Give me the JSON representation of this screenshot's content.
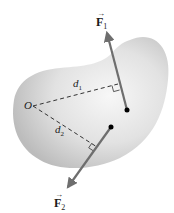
{
  "diagram": {
    "type": "torque-moment-arms",
    "colors": {
      "body_fill_light": "#f4f4f4",
      "body_fill_dark": "#bdbdbd",
      "vector": "#6e6e6e",
      "dashed": "#333333",
      "dot": "#000000",
      "text": "#1a1a1a"
    },
    "labels": {
      "F1": {
        "symbol": "F",
        "subscript": "1",
        "arrow": "→"
      },
      "F2": {
        "symbol": "F",
        "subscript": "2",
        "arrow": "→"
      },
      "O": "O",
      "d1": {
        "symbol": "d",
        "subscript": "1"
      },
      "d2": {
        "symbol": "d",
        "subscript": "2"
      }
    },
    "points": {
      "O": [
        33,
        106
      ],
      "F1_application": [
        127,
        110
      ],
      "F1_tip": [
        106,
        30
      ],
      "F2_application": [
        111,
        127
      ],
      "F2_tip": [
        66,
        190
      ],
      "d1_foot": [
        118,
        84
      ],
      "d2_foot": [
        97,
        147
      ]
    }
  }
}
